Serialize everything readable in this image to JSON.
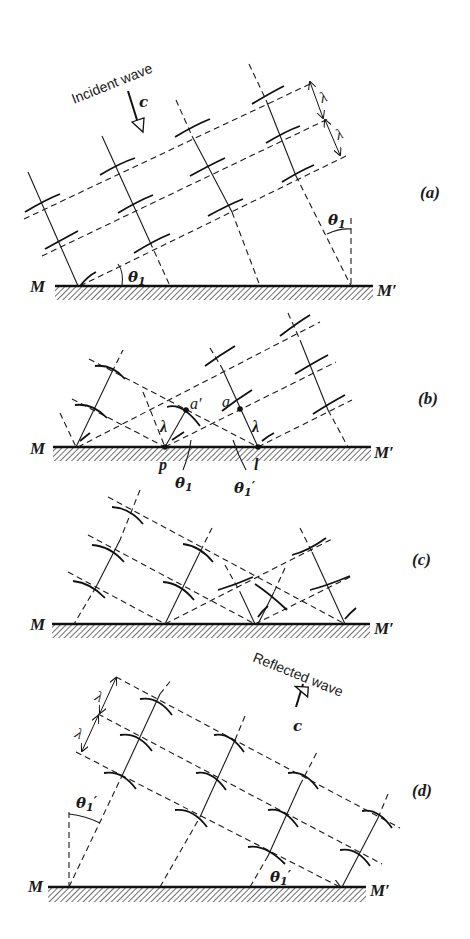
{
  "figure": {
    "panels": [
      {
        "id": "a",
        "label": "(a)",
        "mirror_left": "M",
        "mirror_right": "M′",
        "wave_label": "Incident wave",
        "velocity_label": "c",
        "wavelength_labels": [
          "λ",
          "λ"
        ],
        "angle_labels": [
          "θ1",
          "θ1"
        ]
      },
      {
        "id": "b",
        "label": "(b)",
        "mirror_left": "M",
        "mirror_right": "M′",
        "point_labels": [
          "a′",
          "a",
          "p",
          "l"
        ],
        "wavelength_labels": [
          "λ",
          "λ"
        ],
        "angle_labels": [
          "θ1",
          "θ1′"
        ]
      },
      {
        "id": "c",
        "label": "(c)",
        "mirror_left": "M",
        "mirror_right": "M′"
      },
      {
        "id": "d",
        "label": "(d)",
        "mirror_left": "M",
        "mirror_right": "M′",
        "wave_label": "Reflected wave",
        "velocity_label": "c",
        "wavelength_labels": [
          "λ",
          "λ"
        ],
        "angle_labels": [
          "θ1′",
          "θ1′"
        ]
      }
    ],
    "symbols": {
      "lambda": "λ",
      "theta": "θ",
      "sub1": "1",
      "prime": "′",
      "M": "M",
      "Mp": "M′",
      "c": "c",
      "incident": "Incident wave",
      "reflected": "Reflected wave",
      "a": "a",
      "ap": "a′",
      "p": "p",
      "l": "l",
      "label_a": "(a)",
      "label_b": "(b)",
      "label_c": "(c)",
      "label_d": "(d)"
    }
  }
}
